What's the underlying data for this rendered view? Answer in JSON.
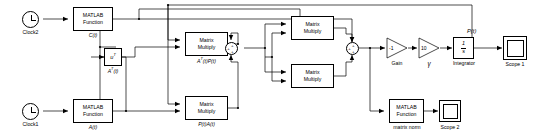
{
  "diagram": {
    "background_color": "#ffffff",
    "line_color": "#000000"
  },
  "sources": [
    {
      "name": "clock2",
      "icon": "clock-icon",
      "label": "Clock2"
    },
    {
      "name": "clock1",
      "icon": "clock-icon",
      "label": "Clock1"
    }
  ],
  "matlab_functions": [
    {
      "name": "matlab-function-c",
      "line1": "MATLAB",
      "line2": "Function",
      "caption": "C(t)"
    },
    {
      "name": "matlab-function-a",
      "line1": "MATLAB",
      "line2": "Function",
      "caption": "A(t)"
    },
    {
      "name": "matlab-function-norm",
      "line1": "MATLAB",
      "line2": "Function",
      "caption": "matrix norm"
    }
  ],
  "transpose_block": {
    "name": "transpose-block",
    "label": "u",
    "exponent": "T",
    "caption": "A",
    "caption_exp": "T",
    "caption_rest": "(t)"
  },
  "matrix_multiply_blocks": [
    {
      "name": "matrix-multiply-at-p",
      "line1": "Matrix",
      "line2": "Multiply",
      "caption": "A^T(t)P(t)"
    },
    {
      "name": "matrix-multiply-p-a",
      "line1": "Matrix",
      "line2": "Multiply",
      "caption": "P(t)A(t)"
    },
    {
      "name": "matrix-multiply-top",
      "line1": "Matrix",
      "line2": "Multiply",
      "caption": ""
    },
    {
      "name": "matrix-multiply-bottom",
      "line1": "Matrix",
      "line2": "Multiply",
      "caption": ""
    }
  ],
  "sum_blocks": [
    {
      "name": "sum-block-1",
      "signs": [
        "+",
        "+",
        "+"
      ]
    },
    {
      "name": "sum-block-2",
      "signs": [
        "+",
        "+",
        "+"
      ]
    }
  ],
  "gain_blocks": [
    {
      "name": "gain-block",
      "value": "-1",
      "caption": "Gain"
    },
    {
      "name": "gamma-gain-block",
      "value": "10",
      "caption": "γ"
    }
  ],
  "integrator": {
    "name": "integrator-block",
    "numerator": "1",
    "denominator": "s",
    "caption": "Integrator"
  },
  "scopes": [
    {
      "name": "scope-1",
      "caption": "Scope 1"
    },
    {
      "name": "scope-2",
      "caption": "Scope 2"
    }
  ],
  "signal_labels": [
    {
      "name": "signal-label-p-of-t",
      "text": "P(t)"
    }
  ]
}
